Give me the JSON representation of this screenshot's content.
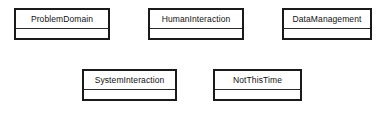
{
  "diagram": {
    "type": "uml-class-diagram",
    "background_color": "#ffffff",
    "border_color": "#1a1a1a",
    "divider_color": "#2b2b2b",
    "text_color": "#111111",
    "classes": [
      {
        "name": "ProblemDomain",
        "x": 14,
        "y": 8,
        "width": 96,
        "height": 32,
        "name_compartment_height": 19,
        "attributes": []
      },
      {
        "name": "HumanInteraction",
        "x": 148,
        "y": 8,
        "width": 96,
        "height": 32,
        "name_compartment_height": 19,
        "attributes": []
      },
      {
        "name": "DataManagement",
        "x": 282,
        "y": 8,
        "width": 90,
        "height": 32,
        "name_compartment_height": 19,
        "attributes": []
      },
      {
        "name": "SystemInteraction",
        "x": 82,
        "y": 69,
        "width": 95,
        "height": 32,
        "name_compartment_height": 19,
        "attributes": []
      },
      {
        "name": "NotThisTime",
        "x": 213,
        "y": 69,
        "width": 89,
        "height": 32,
        "name_compartment_height": 19,
        "attributes": []
      }
    ]
  }
}
